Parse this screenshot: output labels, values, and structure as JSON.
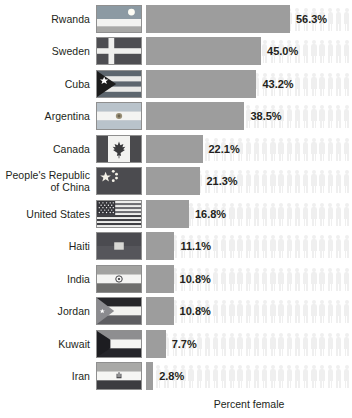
{
  "chart_data": {
    "type": "bar",
    "title": "",
    "xlabel": "Percent female",
    "ylabel": "",
    "orientation": "horizontal",
    "xlim": [
      0,
      80
    ],
    "grid": false,
    "legend": null,
    "units": "%",
    "categories": [
      "Rwanda",
      "Sweden",
      "Cuba",
      "Argentina",
      "Canada",
      "People's Republic of China",
      "United States",
      "Haiti",
      "India",
      "Jordan",
      "Kuwait",
      "Iran"
    ],
    "values": [
      56.3,
      45.0,
      43.2,
      38.5,
      22.1,
      21.3,
      16.8,
      11.1,
      10.8,
      10.8,
      7.7,
      2.8
    ],
    "value_labels": [
      "56.3%",
      "45.0%",
      "43.2%",
      "38.5%",
      "22.1%",
      "21.3%",
      "16.8%",
      "11.1%",
      "10.8%",
      "10.8%",
      "7.7%",
      "2.8%"
    ],
    "background_pictograms": "faint-person-icons",
    "bar_color": "#9d9d9d",
    "text_color": "#231f20"
  },
  "axis": {
    "xlabel": "Percent female"
  },
  "rows": [
    {
      "country": "Rwanda",
      "country_line1": "Rwanda",
      "country_line2": "",
      "value": 56.3,
      "value_label": "56.3%",
      "flag": "flag-rwanda"
    },
    {
      "country": "Sweden",
      "country_line1": "Sweden",
      "country_line2": "",
      "value": 45.0,
      "value_label": "45.0%",
      "flag": "flag-sweden"
    },
    {
      "country": "Cuba",
      "country_line1": "Cuba",
      "country_line2": "",
      "value": 43.2,
      "value_label": "43.2%",
      "flag": "flag-cuba"
    },
    {
      "country": "Argentina",
      "country_line1": "Argentina",
      "country_line2": "",
      "value": 38.5,
      "value_label": "38.5%",
      "flag": "flag-argentina"
    },
    {
      "country": "Canada",
      "country_line1": "Canada",
      "country_line2": "",
      "value": 22.1,
      "value_label": "22.1%",
      "flag": "flag-canada"
    },
    {
      "country": "People's Republic of China",
      "country_line1": "People's Republic",
      "country_line2": "of China",
      "value": 21.3,
      "value_label": "21.3%",
      "flag": "flag-china"
    },
    {
      "country": "United States",
      "country_line1": "United States",
      "country_line2": "",
      "value": 16.8,
      "value_label": "16.8%",
      "flag": "flag-united-states"
    },
    {
      "country": "Haiti",
      "country_line1": "Haiti",
      "country_line2": "",
      "value": 11.1,
      "value_label": "11.1%",
      "flag": "flag-haiti"
    },
    {
      "country": "India",
      "country_line1": "India",
      "country_line2": "",
      "value": 10.8,
      "value_label": "10.8%",
      "flag": "flag-india"
    },
    {
      "country": "Jordan",
      "country_line1": "Jordan",
      "country_line2": "",
      "value": 10.8,
      "value_label": "10.8%",
      "flag": "flag-jordan"
    },
    {
      "country": "Kuwait",
      "country_line1": "Kuwait",
      "country_line2": "",
      "value": 7.7,
      "value_label": "7.7%",
      "flag": "flag-kuwait"
    },
    {
      "country": "Iran",
      "country_line1": "Iran",
      "country_line2": "",
      "value": 2.8,
      "value_label": "2.8%",
      "flag": "flag-iran"
    }
  ]
}
